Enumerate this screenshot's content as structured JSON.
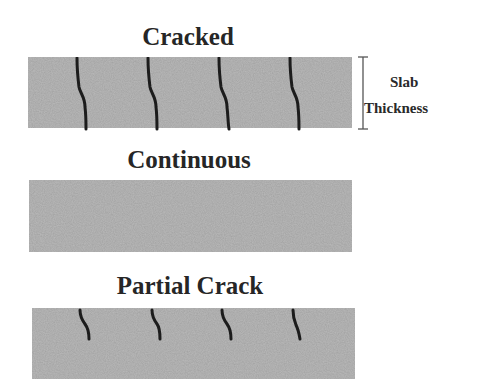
{
  "diagram": {
    "colors": {
      "slab_fill": "#b9b9b9",
      "crack": "#1c1c1c",
      "text": "#262626",
      "bracket": "#555555"
    },
    "slabs": [
      {
        "id": "cracked",
        "title": "Cracked",
        "crack_type": "full-depth",
        "crack_count": 4
      },
      {
        "id": "continuous",
        "title": "Continuous",
        "crack_type": "none",
        "crack_count": 0
      },
      {
        "id": "partial",
        "title": "Partial Crack",
        "crack_type": "partial-depth",
        "crack_count": 4
      }
    ],
    "dimension": {
      "label_line1": "Slab",
      "label_line2": "Thickness"
    }
  }
}
